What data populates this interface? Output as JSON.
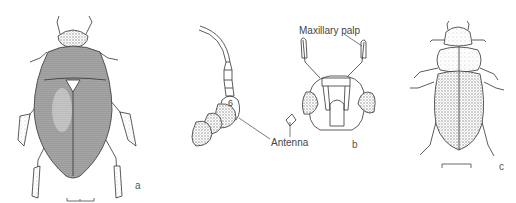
{
  "figure": {
    "panels": [
      {
        "id": "a",
        "label": "a",
        "subject": "water beetle dorsal view"
      },
      {
        "id": "b",
        "label": "b",
        "subject": "head frontal view"
      },
      {
        "id": "c",
        "label": "c",
        "subject": "beetle dorsal view"
      }
    ],
    "annotations": {
      "maxillary_palp": "Maxillary palp",
      "antenna": "Antenna",
      "segment_number": "6"
    },
    "colors": {
      "ink": "#333333",
      "stipple": "#8a8a8a",
      "background": "#ffffff"
    }
  }
}
